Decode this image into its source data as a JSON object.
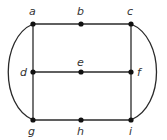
{
  "diagram": {
    "type": "graph",
    "nodes": [
      {
        "id": "a",
        "label": "a",
        "x": 33,
        "y": 24,
        "lx": 29,
        "ly": 15
      },
      {
        "id": "b",
        "label": "b",
        "x": 81,
        "y": 24,
        "lx": 77,
        "ly": 15
      },
      {
        "id": "c",
        "label": "c",
        "x": 131,
        "y": 24,
        "lx": 127,
        "ly": 15
      },
      {
        "id": "d",
        "label": "d",
        "x": 33,
        "y": 72,
        "lx": 20,
        "ly": 76
      },
      {
        "id": "e",
        "label": "e",
        "x": 81,
        "y": 72,
        "lx": 77,
        "ly": 66
      },
      {
        "id": "f",
        "label": "f",
        "x": 131,
        "y": 72,
        "lx": 137,
        "ly": 76
      },
      {
        "id": "g",
        "label": "g",
        "x": 33,
        "y": 120,
        "lx": 28,
        "ly": 135
      },
      {
        "id": "h",
        "label": "h",
        "x": 81,
        "y": 120,
        "lx": 77,
        "ly": 135
      },
      {
        "id": "i",
        "label": "i",
        "x": 131,
        "y": 120,
        "lx": 129,
        "ly": 135
      }
    ],
    "edges": [
      [
        "a",
        "b"
      ],
      [
        "b",
        "c"
      ],
      [
        "d",
        "e"
      ],
      [
        "e",
        "f"
      ],
      [
        "g",
        "h"
      ],
      [
        "h",
        "i"
      ],
      [
        "a",
        "d"
      ],
      [
        "d",
        "g"
      ],
      [
        "c",
        "f"
      ],
      [
        "f",
        "i"
      ],
      [
        "a",
        "g",
        "curved-left"
      ],
      [
        "c",
        "i",
        "curved-right"
      ]
    ],
    "colors": {
      "edge": "#2a2a2a",
      "node": "#111111",
      "label": "#333333"
    }
  }
}
